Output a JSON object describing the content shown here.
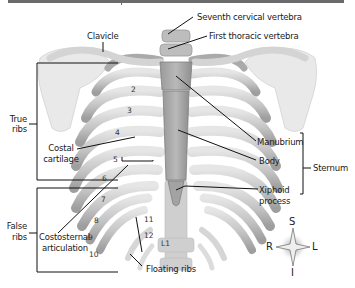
{
  "figure": {
    "colors": {
      "bone_fill": "#c9c9c9",
      "bone_shade": "#a9a9a9",
      "bone_highlight": "#ececec",
      "cartilage": "#b8b8b8",
      "leader_lines": "#111111",
      "top_rule": "#6b6b6b"
    }
  },
  "labels": {
    "seventh_cervical": "Seventh cervical vertebra",
    "first_thoracic": "First thoracic vertebra",
    "clavicle": "Clavicle",
    "true_ribs_1": "True",
    "true_ribs_2": "ribs",
    "costal_cartilage_1": "Costal",
    "costal_cartilage_2": "cartilage",
    "manubrium": "Manubrium",
    "body": "Body",
    "sternum": "Sternum",
    "xiphoid_1": "Xiphoid",
    "xiphoid_2": "process",
    "false_ribs_1": "False",
    "false_ribs_2": "ribs",
    "costosternal_1": "Costosternal",
    "costosternal_2": "articulation",
    "floating_ribs": "Floating ribs"
  },
  "rib_numbers": [
    "2",
    "3",
    "4",
    "5",
    "6",
    "7",
    "8",
    "9",
    "10",
    "11",
    "12"
  ],
  "vertebra_label": "L1",
  "compass": {
    "superior": "S",
    "inferior": "I",
    "right": "R",
    "left": "L"
  }
}
